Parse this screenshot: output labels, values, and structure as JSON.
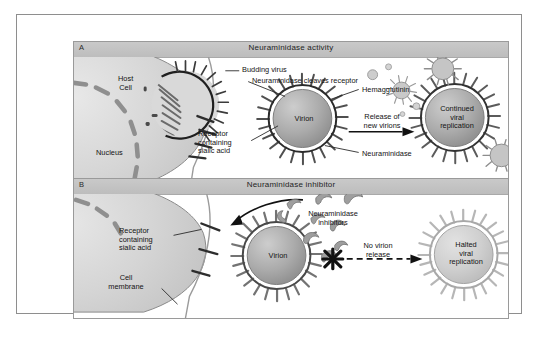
{
  "figure": {
    "panels": [
      {
        "id": "A",
        "letter": "A",
        "title": "Neuraminidase activity",
        "labels": {
          "host_cell": "Host\nCell",
          "nucleus": "Nucleus",
          "receptor": "Receptor\ncontaining\nsialic acid",
          "budding_virus": "Budding virus",
          "cleaves": "Neuraminidase cleaves receptor",
          "hemagglutinin": "Hemagglutinin",
          "neuraminidase": "Neuraminidase",
          "arrow": "Release of\nnew virions",
          "virion": "Virion",
          "outcome": "Continued\nviral\nreplication"
        }
      },
      {
        "id": "B",
        "letter": "B",
        "title": "Neuraminidase inhibitor",
        "labels": {
          "receptor": "Receptor\ncontaining\nsialic acid",
          "cell_membrane": "Cell\nmembrane",
          "inhibitors": "Neuraminidase\ninhibitors",
          "arrow": "No virion\nrelease",
          "virion": "Virion",
          "outcome": "Halted\nviral\nreplication"
        }
      }
    ]
  },
  "colors": {
    "frame_border": "#8e8e8e",
    "header_bar": "#c4c4c4",
    "cell_fill": "#d2d2d2",
    "nucleus_segment": "#9a9a9a",
    "virion_core": "#a9a9a9",
    "virion_spike": "#6e6e6e",
    "faded_virion": "#bdbdbd",
    "text": "#131313",
    "arrow": "#111111"
  }
}
